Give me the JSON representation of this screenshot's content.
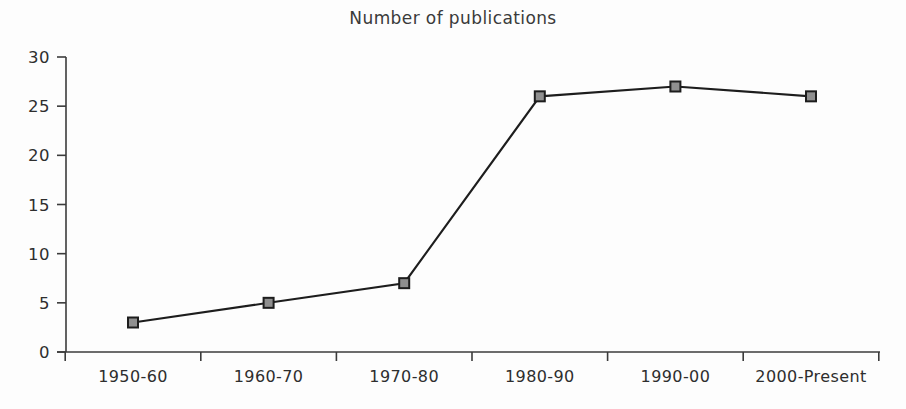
{
  "chart_data": {
    "type": "line",
    "title": "Number of publications",
    "xlabel": "",
    "ylabel": "",
    "categories": [
      "1950-60",
      "1960-70",
      "1970-80",
      "1980-90",
      "1990-00",
      "2000-Present"
    ],
    "values": [
      3,
      5,
      7,
      26,
      27,
      26
    ],
    "series": [
      {
        "name": "Number of publications",
        "values": [
          3,
          5,
          7,
          26,
          27,
          26
        ]
      }
    ],
    "ylim": [
      0,
      30
    ],
    "ytick_labels": [
      "0",
      "5",
      "10",
      "15",
      "20",
      "25",
      "30"
    ],
    "ytick_values": [
      0,
      5,
      10,
      15,
      20,
      25,
      30
    ],
    "grid": false,
    "legend": false,
    "legend_position": "none",
    "marker_style": "square",
    "colors": {
      "line": "#1d1d1d",
      "marker_fill": "#8f8f8f",
      "marker_stroke": "#1d1d1d",
      "axis": "#3b3b3b",
      "text": "#2e2e2e",
      "background": "#fdfdfd"
    }
  }
}
